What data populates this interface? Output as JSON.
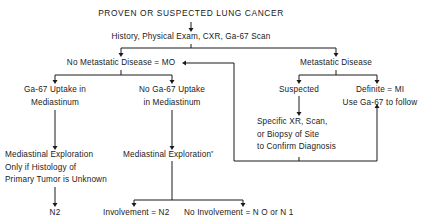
{
  "diagram": {
    "title": "PROVEN OR SUSPECTED LUNG CANCER",
    "initial_workup": "History, Physical Exam, CXR, Ga-67 Scan",
    "left_branch": {
      "label": "No Metastatic Disease = MO",
      "uptake": {
        "line1": "Ga-67 Uptake in",
        "line2": "Mediastinum",
        "action_line1": "Mediastinal Exploration",
        "action_line2": "Only if Histology of",
        "action_line3": "Primary Tumor is Unknown",
        "result": "N2"
      },
      "no_uptake": {
        "line1": "No Ga-67 Uptake",
        "line2": "in Mediastinum",
        "action": "Mediastinal Exploration",
        "action_footnote": "*",
        "outcome_positive": "Involvement = N2",
        "outcome_negative": "No Involvement = N O or N 1"
      }
    },
    "right_branch": {
      "label": "Metastatic Disease",
      "suspected": {
        "label": "Suspected",
        "action_line1": "Specific XR, Scan,",
        "action_line2": "or Biopsy of Site",
        "action_line3": "to Confirm Diagnosis"
      },
      "definite": {
        "line1": "Definite = MI",
        "line2": "Use Ga-67 to follow"
      }
    }
  }
}
